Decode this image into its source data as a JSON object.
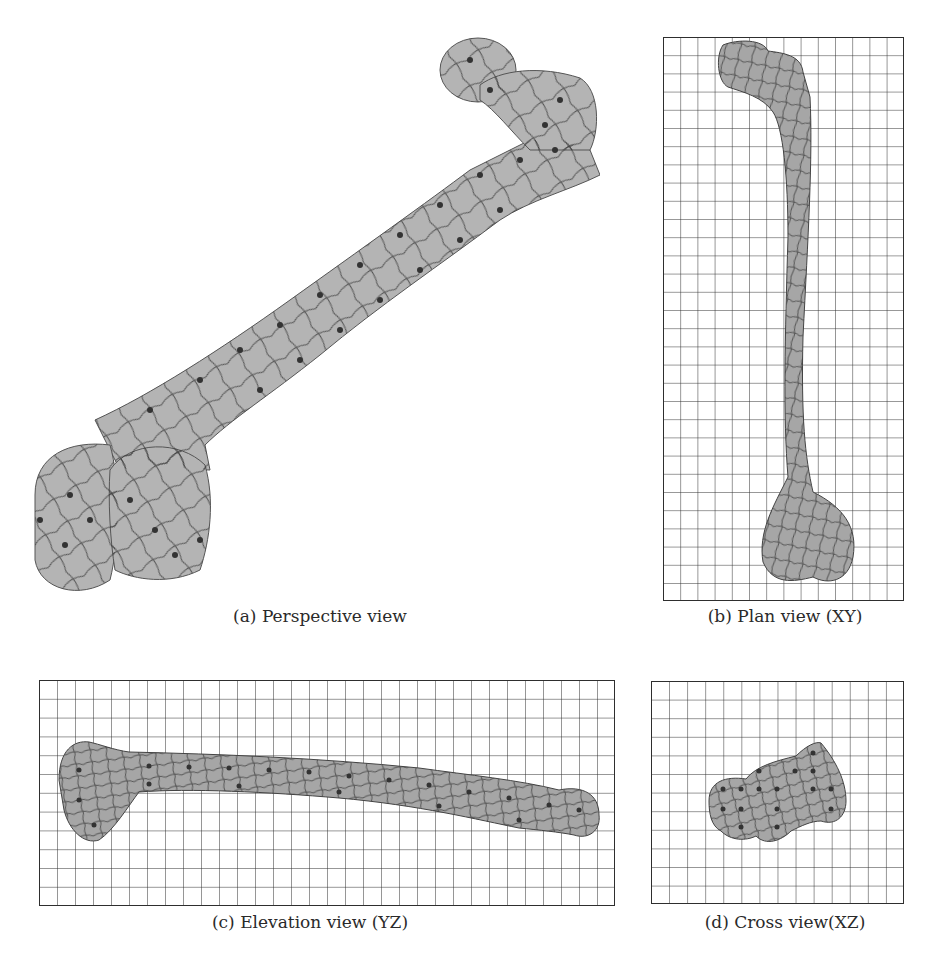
{
  "figure": {
    "panels": [
      {
        "id": "a",
        "caption": "(a) Perspective view"
      },
      {
        "id": "b",
        "caption": "(b) Plan view (XY)",
        "grid": {
          "cols": 14,
          "rows": 31
        }
      },
      {
        "id": "c",
        "caption": "(c) Elevation view (YZ)",
        "grid": {
          "cols": 32,
          "rows": 12
        }
      },
      {
        "id": "d",
        "caption": "(d) Cross view(XZ)",
        "grid": {
          "cols": 14,
          "rows": 12
        }
      }
    ],
    "colors": {
      "bone_fill": "#b4b4b4",
      "bone_fill_dark": "#a6a6a6",
      "mesh_line": "#3a3a3a",
      "grid_line": "#2e2e2e",
      "control_point": "#333333"
    }
  }
}
